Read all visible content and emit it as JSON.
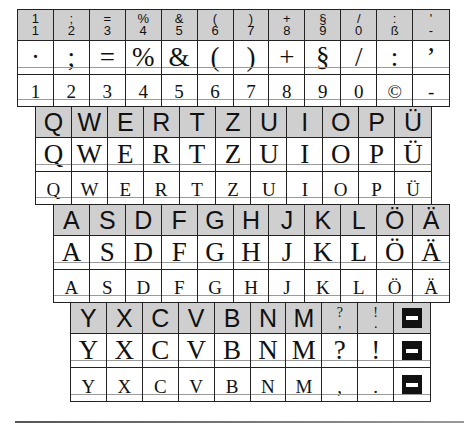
{
  "colors": {
    "header_bg": "#cfcfcf",
    "border": "#222222",
    "guide_line": "#9a9a9a",
    "text": "#111111"
  },
  "number_row": {
    "header": [
      {
        "top": ";",
        "bottom": "1",
        "top_display": "1"
      },
      {
        "top": ";",
        "bottom": "2"
      },
      {
        "top": "=",
        "bottom": "3"
      },
      {
        "top": "%",
        "bottom": "4"
      },
      {
        "top": "&",
        "bottom": "5"
      },
      {
        "top": "(",
        "bottom": "6"
      },
      {
        "top": ")",
        "bottom": "7"
      },
      {
        "top": "+",
        "bottom": "8"
      },
      {
        "top": "§",
        "bottom": "9"
      },
      {
        "top": "/",
        "bottom": "0"
      },
      {
        "top": ":",
        "bottom": "ß"
      },
      {
        "top": "'",
        "bottom": "-"
      }
    ],
    "large": [
      "·",
      ";",
      "=",
      "%",
      "&",
      "(",
      ")",
      "+",
      "§",
      "/",
      ":",
      "’"
    ],
    "small": [
      "1",
      "2",
      "3",
      "4",
      "5",
      "6",
      "7",
      "8",
      "9",
      "0",
      "©",
      "-"
    ]
  },
  "qwertz_row": {
    "header": [
      "Q",
      "W",
      "E",
      "R",
      "T",
      "Z",
      "U",
      "I",
      "O",
      "P",
      "Ü"
    ],
    "large": [
      "Q",
      "W",
      "E",
      "R",
      "T",
      "Z",
      "U",
      "I",
      "O",
      "P",
      "Ü"
    ],
    "small": [
      "Q",
      "W",
      "E",
      "R",
      "T",
      "Z",
      "U",
      "I",
      "O",
      "P",
      "Ü"
    ]
  },
  "asdf_row": {
    "header": [
      "A",
      "S",
      "D",
      "F",
      "G",
      "H",
      "J",
      "K",
      "L",
      "Ö",
      "Ä"
    ],
    "large": [
      "A",
      "S",
      "D",
      "F",
      "G",
      "H",
      "J",
      "K",
      "L",
      "Ö",
      "Ä"
    ],
    "small": [
      "A",
      "S",
      "D",
      "F",
      "G",
      "H",
      "J",
      "K",
      "L",
      "Ö",
      "Ä"
    ]
  },
  "yxcv_row": {
    "header": [
      {
        "type": "big",
        "text": "Y"
      },
      {
        "type": "big",
        "text": "X"
      },
      {
        "type": "big",
        "text": "C"
      },
      {
        "type": "big",
        "text": "V"
      },
      {
        "type": "big",
        "text": "B"
      },
      {
        "type": "big",
        "text": "N"
      },
      {
        "type": "big",
        "text": "M"
      },
      {
        "type": "stack",
        "top": "?",
        "bottom": ","
      },
      {
        "type": "stack",
        "top": "!",
        "bottom": "."
      },
      {
        "type": "icon",
        "icon": "space-key-icon"
      }
    ],
    "large": [
      "Y",
      "X",
      "C",
      "V",
      "B",
      "N",
      "M",
      "?",
      "!",
      "space-key-icon"
    ],
    "small": [
      "Y",
      "X",
      "C",
      "V",
      "B",
      "N",
      "M",
      ",",
      ".",
      "space-key-icon"
    ]
  }
}
